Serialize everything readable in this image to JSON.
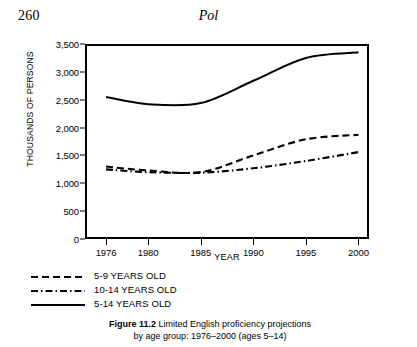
{
  "page": {
    "folio": "260",
    "running_title": "Pol"
  },
  "figure": {
    "caption_bold": "Figure 11.2",
    "caption_rest": "Limited English proficiency projections",
    "caption_line2": "by age group: 1976–2000 (ages 5–14)"
  },
  "legend": {
    "position": "below-axis-left",
    "items": [
      {
        "style": "dashed",
        "label": "5-9 YEARS OLD"
      },
      {
        "style": "dashdot",
        "label": "10-14 YEARS OLD"
      },
      {
        "style": "solid",
        "label": "5-14 YEARS OLD"
      }
    ]
  },
  "chart_data": {
    "type": "line",
    "title": "Limited English proficiency projections by age group: 1976–2000 (ages 5–14)",
    "xlabel": "YEAR",
    "ylabel": "THOUSANDS OF PERSONS",
    "xlim": [
      1974,
      2001
    ],
    "ylim": [
      0,
      3500
    ],
    "grid": false,
    "xticks": [
      1976,
      1980,
      1985,
      1990,
      1995,
      2000
    ],
    "xtick_labels": [
      "1976",
      "1980",
      "1985",
      "1990",
      "1995",
      "2000"
    ],
    "yticks": [
      0,
      500,
      1000,
      1500,
      2000,
      2500,
      3000,
      3500
    ],
    "ytick_labels": [
      "0",
      "500",
      "1,000",
      "1,500",
      "2,000",
      "2,500",
      "3,000",
      "3,500"
    ],
    "x": [
      1976,
      1980,
      1985,
      1990,
      1995,
      2000
    ],
    "series": [
      {
        "name": "5-9 YEARS OLD",
        "style": "dashed",
        "color": "#000000",
        "values": [
          1300,
          1230,
          1200,
          1500,
          1790,
          1870
        ]
      },
      {
        "name": "10-14 YEARS OLD",
        "style": "dashdot",
        "color": "#000000",
        "values": [
          1250,
          1200,
          1190,
          1270,
          1400,
          1560
        ]
      },
      {
        "name": "5-14 YEARS OLD",
        "style": "solid",
        "color": "#000000",
        "values": [
          2550,
          2420,
          2440,
          2840,
          3250,
          3350
        ]
      }
    ]
  }
}
